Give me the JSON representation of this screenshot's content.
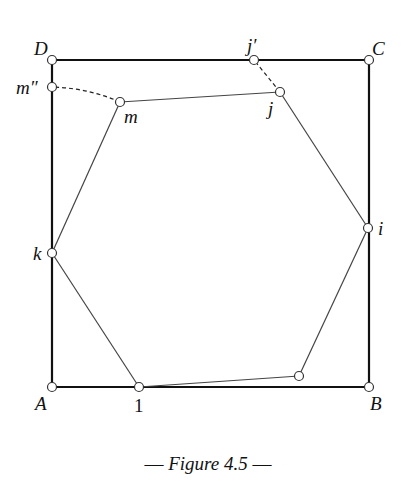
{
  "figure": {
    "caption_prefix": "— ",
    "caption_title": "Figure 4.5",
    "caption_suffix": " —"
  },
  "points": {
    "A": "A",
    "B": "B",
    "C": "C",
    "D": "D",
    "m_double_prime": "m″",
    "m": "m",
    "j_prime": "j′",
    "j": "j",
    "k": "k",
    "i": "i",
    "one": "1"
  },
  "colors": {
    "square_stroke": "#111111",
    "hexagon_stroke": "#444444",
    "vertex_fill": "#ffffff"
  }
}
